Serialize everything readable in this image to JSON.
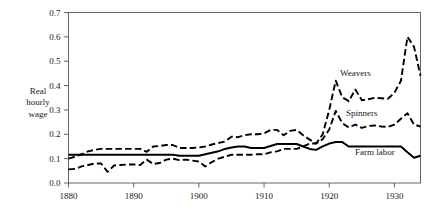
{
  "chart_data": {
    "type": "line",
    "title": "",
    "xlabel": "",
    "ylabel": "Real hourly wage",
    "ylabel_lines": [
      "Real",
      "hourly",
      "wage"
    ],
    "xlim": [
      1880,
      1934
    ],
    "ylim": [
      0.0,
      0.7
    ],
    "grid": false,
    "legend_position": "inline-annotations",
    "xticks": [
      1880,
      1890,
      1900,
      1910,
      1920,
      1930
    ],
    "xtick_labels": [
      "1880",
      "1890",
      "1900",
      "1910",
      "1920",
      "1930"
    ],
    "yticks": [
      0.0,
      0.1,
      0.2,
      0.3,
      0.4,
      0.5,
      0.6,
      0.7
    ],
    "ytick_labels": [
      "0.0",
      "0.1",
      "0.2",
      "0.3",
      "0.4",
      "0.5",
      "0.6",
      "0.7"
    ],
    "series": [
      {
        "name": "Weavers",
        "style": "dashed",
        "color": "#000000",
        "annotation": "Weavers",
        "x": [
          1880,
          1881,
          1882,
          1883,
          1884,
          1885,
          1886,
          1887,
          1888,
          1889,
          1890,
          1891,
          1892,
          1893,
          1894,
          1895,
          1896,
          1897,
          1898,
          1899,
          1900,
          1901,
          1902,
          1903,
          1904,
          1905,
          1906,
          1907,
          1908,
          1909,
          1910,
          1911,
          1912,
          1913,
          1914,
          1915,
          1916,
          1917,
          1918,
          1919,
          1920,
          1921,
          1922,
          1923,
          1924,
          1925,
          1926,
          1927,
          1928,
          1929,
          1930,
          1931,
          1932,
          1933,
          1934
        ],
        "values": [
          0.1,
          0.108,
          0.118,
          0.13,
          0.136,
          0.14,
          0.14,
          0.14,
          0.14,
          0.14,
          0.14,
          0.14,
          0.128,
          0.15,
          0.152,
          0.156,
          0.156,
          0.144,
          0.144,
          0.144,
          0.146,
          0.15,
          0.158,
          0.164,
          0.17,
          0.19,
          0.188,
          0.196,
          0.2,
          0.2,
          0.204,
          0.218,
          0.218,
          0.196,
          0.214,
          0.218,
          0.196,
          0.178,
          0.162,
          0.2,
          0.3,
          0.42,
          0.352,
          0.336,
          0.384,
          0.34,
          0.344,
          0.35,
          0.348,
          0.346,
          0.37,
          0.42,
          0.6,
          0.56,
          0.44
        ]
      },
      {
        "name": "Spinners",
        "style": "dashed",
        "color": "#000000",
        "annotation": "Spinners",
        "x": [
          1880,
          1881,
          1882,
          1883,
          1884,
          1885,
          1886,
          1887,
          1888,
          1889,
          1890,
          1891,
          1892,
          1893,
          1894,
          1895,
          1896,
          1897,
          1898,
          1899,
          1900,
          1901,
          1902,
          1903,
          1904,
          1905,
          1906,
          1907,
          1908,
          1909,
          1910,
          1911,
          1912,
          1913,
          1914,
          1915,
          1916,
          1917,
          1918,
          1919,
          1920,
          1921,
          1922,
          1923,
          1924,
          1925,
          1926,
          1927,
          1928,
          1929,
          1930,
          1931,
          1932,
          1933,
          1934
        ],
        "values": [
          0.056,
          0.058,
          0.068,
          0.074,
          0.08,
          0.08,
          0.046,
          0.072,
          0.074,
          0.076,
          0.076,
          0.074,
          0.096,
          0.078,
          0.082,
          0.096,
          0.1,
          0.094,
          0.096,
          0.092,
          0.088,
          0.068,
          0.086,
          0.1,
          0.108,
          0.116,
          0.116,
          0.116,
          0.116,
          0.118,
          0.118,
          0.126,
          0.13,
          0.14,
          0.14,
          0.14,
          0.15,
          0.162,
          0.162,
          0.18,
          0.22,
          0.296,
          0.246,
          0.228,
          0.24,
          0.226,
          0.234,
          0.236,
          0.232,
          0.23,
          0.24,
          0.264,
          0.286,
          0.24,
          0.232
        ]
      },
      {
        "name": "Farm labor",
        "style": "solid",
        "color": "#000000",
        "annotation": "Farm labor",
        "x": [
          1880,
          1881,
          1882,
          1883,
          1884,
          1885,
          1886,
          1887,
          1888,
          1889,
          1890,
          1891,
          1892,
          1893,
          1894,
          1895,
          1896,
          1897,
          1898,
          1899,
          1900,
          1901,
          1902,
          1903,
          1904,
          1905,
          1906,
          1907,
          1908,
          1909,
          1910,
          1911,
          1912,
          1913,
          1914,
          1915,
          1916,
          1917,
          1918,
          1919,
          1920,
          1921,
          1922,
          1923,
          1924,
          1925,
          1926,
          1927,
          1928,
          1929,
          1930,
          1931,
          1932,
          1933,
          1934
        ],
        "values": [
          0.116,
          0.116,
          0.116,
          0.116,
          0.116,
          0.116,
          0.116,
          0.116,
          0.116,
          0.116,
          0.116,
          0.116,
          0.116,
          0.116,
          0.116,
          0.116,
          0.116,
          0.112,
          0.112,
          0.112,
          0.112,
          0.118,
          0.124,
          0.13,
          0.14,
          0.146,
          0.15,
          0.15,
          0.144,
          0.144,
          0.144,
          0.152,
          0.16,
          0.16,
          0.16,
          0.16,
          0.15,
          0.14,
          0.136,
          0.15,
          0.162,
          0.168,
          0.168,
          0.15,
          0.15,
          0.15,
          0.15,
          0.15,
          0.15,
          0.15,
          0.15,
          0.15,
          0.126,
          0.104,
          0.112
        ]
      }
    ],
    "annotations": [
      {
        "text": "Weavers",
        "x": 1924,
        "y": 0.44
      },
      {
        "text": "Spinners",
        "x": 1925,
        "y": 0.275
      },
      {
        "text": "Farm labor",
        "x": 1927,
        "y": 0.115
      }
    ]
  }
}
